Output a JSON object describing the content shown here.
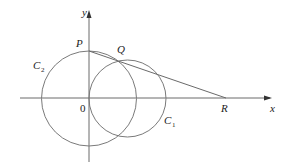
{
  "diagram": {
    "axes": {
      "x_label": "x",
      "y_label": "y",
      "origin_label": "0"
    },
    "points": {
      "P": "P",
      "Q": "Q",
      "R": "R"
    },
    "circles": {
      "C1": {
        "label": "C",
        "subscript": "1"
      },
      "C2": {
        "label": "C",
        "subscript": "2"
      }
    },
    "colors": {
      "stroke": "#6a6a6a",
      "text": "#222222",
      "background": "#ffffff"
    }
  }
}
